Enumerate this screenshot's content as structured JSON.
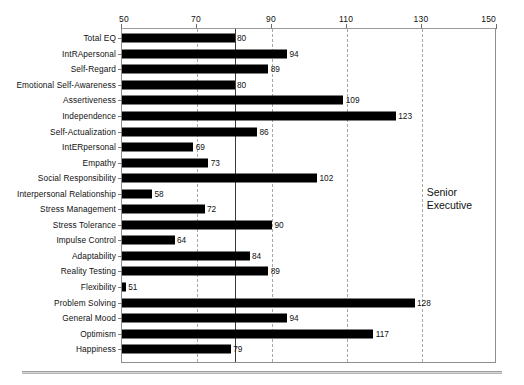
{
  "chart_data": {
    "type": "bar",
    "orientation": "horizontal",
    "title": "",
    "xlabel": "",
    "ylabel": "",
    "xlim": [
      50,
      150
    ],
    "xticks": [
      50,
      70,
      90,
      110,
      130,
      150
    ],
    "grid": true,
    "gridlines_dashed_at": [
      70,
      90,
      110,
      130
    ],
    "reference_line": 80,
    "legend": null,
    "annotation": "Senior\nExecutive",
    "categories": [
      "Total EQ",
      "IntRApersonal",
      "Self-Regard",
      "Emotional Self-Awareness",
      "Assertiveness",
      "Independence",
      "Self-Actualization",
      "IntERpersonal",
      "Empathy",
      "Social Responsibility",
      "Interpersonal Relationship",
      "Stress Management",
      "Stress Tolerance",
      "Impulse Control",
      "Adaptability",
      "Reality Testing",
      "Flexibility",
      "Problem Solving",
      "General Mood",
      "Optimism",
      "Happiness"
    ],
    "values": [
      80,
      94,
      89,
      80,
      109,
      123,
      86,
      69,
      73,
      102,
      58,
      72,
      90,
      64,
      84,
      89,
      51,
      128,
      94,
      117,
      79
    ],
    "bar_color": "#000000"
  },
  "axis": {
    "tick_labels": [
      "50",
      "70",
      "90",
      "110",
      "130",
      "150"
    ]
  },
  "annotation": {
    "line1": "Senior",
    "line2": "Executive"
  }
}
